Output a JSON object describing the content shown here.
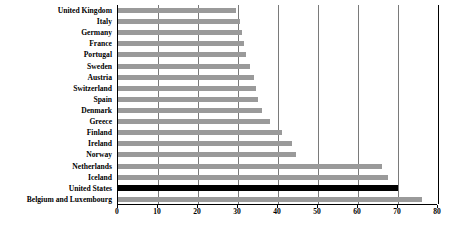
{
  "chart": {
    "type": "bar",
    "orientation": "horizontal",
    "title": "",
    "xlabel": "",
    "ylabel": ""
  },
  "axis": {
    "ticks": [
      "0",
      "10",
      "20",
      "30",
      "40",
      "50",
      "60",
      "70",
      "80"
    ],
    "min": 0,
    "max": 80,
    "step": 10,
    "grid": true
  },
  "colors": {
    "bar": "#9a9a9a",
    "highlight": "#000000",
    "grid": "#7a7a7a",
    "axis": "#000000",
    "background": "#ffffff"
  },
  "chart_data": {
    "type": "bar",
    "orientation": "horizontal",
    "title": "",
    "xlabel": "",
    "ylabel": "",
    "xlim": [
      0,
      80
    ],
    "grid": true,
    "legend": "none",
    "xticks": [
      0,
      10,
      20,
      30,
      40,
      50,
      60,
      70,
      80
    ],
    "categories": [
      "United Kingdom",
      "Italy",
      "Germany",
      "France",
      "Portugal",
      "Sweden",
      "Austria",
      "Switzerland",
      "Spain",
      "Denmark",
      "Greece",
      "Finland",
      "Ireland",
      "Norway",
      "Netherlands",
      "Iceland",
      "United States",
      "Belgium and Luxembourg"
    ],
    "values": [
      29.5,
      30.5,
      31,
      31.5,
      32,
      33,
      34,
      34.5,
      35,
      36,
      38,
      41,
      43.5,
      44.5,
      66,
      67.5,
      70,
      76
    ],
    "highlighted": [
      "United States"
    ],
    "bars": [
      {
        "label": "United Kingdom",
        "value": 29.5,
        "highlight": false
      },
      {
        "label": "Italy",
        "value": 30.5,
        "highlight": false
      },
      {
        "label": "Germany",
        "value": 31,
        "highlight": false
      },
      {
        "label": "France",
        "value": 31.5,
        "highlight": false
      },
      {
        "label": "Portugal",
        "value": 32,
        "highlight": false
      },
      {
        "label": "Sweden",
        "value": 33,
        "highlight": false
      },
      {
        "label": "Austria",
        "value": 34,
        "highlight": false
      },
      {
        "label": "Switzerland",
        "value": 34.5,
        "highlight": false
      },
      {
        "label": "Spain",
        "value": 35,
        "highlight": false
      },
      {
        "label": "Denmark",
        "value": 36,
        "highlight": false
      },
      {
        "label": "Greece",
        "value": 38,
        "highlight": false
      },
      {
        "label": "Finland",
        "value": 41,
        "highlight": false
      },
      {
        "label": "Ireland",
        "value": 43.5,
        "highlight": false
      },
      {
        "label": "Norway",
        "value": 44.5,
        "highlight": false
      },
      {
        "label": "Netherlands",
        "value": 66,
        "highlight": false
      },
      {
        "label": "Iceland",
        "value": 67.5,
        "highlight": false
      },
      {
        "label": "United States",
        "value": 70,
        "highlight": true
      },
      {
        "label": "Belgium and Luxembourg",
        "value": 76,
        "highlight": false
      }
    ]
  }
}
